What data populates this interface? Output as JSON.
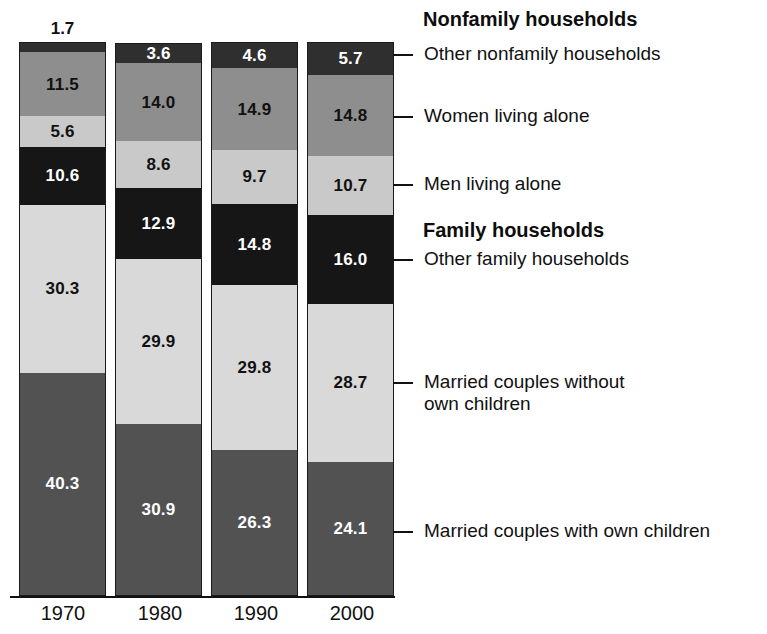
{
  "chart_data": {
    "type": "bar",
    "stacked": true,
    "orientation": "vertical",
    "unit": "percent",
    "ylim": [
      0,
      100
    ],
    "grid": false,
    "legend_position": "right",
    "axis_color": "#111111",
    "categories": [
      "1970",
      "1980",
      "1990",
      "2000"
    ],
    "series": [
      {
        "name": "Other nonfamily households",
        "values": [
          1.7,
          3.6,
          4.6,
          5.7
        ],
        "labels": [
          "1.7",
          "3.6",
          "4.6",
          "5.7"
        ],
        "color": "#2f2f2f",
        "label_color": "#ffffff"
      },
      {
        "name": "Women living alone",
        "values": [
          11.5,
          14.0,
          14.9,
          14.8
        ],
        "labels": [
          "11.5",
          "14.0",
          "14.9",
          "14.8"
        ],
        "color": "#8e8e8e",
        "label_color": "#111111"
      },
      {
        "name": "Men living alone",
        "values": [
          5.6,
          8.6,
          9.7,
          10.7
        ],
        "labels": [
          "5.6",
          "8.6",
          "9.7",
          "10.7"
        ],
        "color": "#c9c9c9",
        "label_color": "#111111"
      },
      {
        "name": "Other family households",
        "values": [
          10.6,
          12.9,
          14.8,
          16.0
        ],
        "labels": [
          "10.6",
          "12.9",
          "14.8",
          "16.0"
        ],
        "color": "#161616",
        "label_color": "#ffffff"
      },
      {
        "name": "Married couples without own children",
        "values": [
          30.3,
          29.9,
          29.8,
          28.7
        ],
        "labels": [
          "30.3",
          "29.9",
          "29.8",
          "28.7"
        ],
        "color": "#d9d9d9",
        "label_color": "#111111"
      },
      {
        "name": "Married couples with own children",
        "values": [
          40.3,
          30.9,
          26.3,
          24.1
        ],
        "labels": [
          "40.3",
          "30.9",
          "26.3",
          "24.1"
        ],
        "color": "#525252",
        "label_color": "#ffffff"
      }
    ]
  },
  "legend": {
    "group_headers": {
      "nonfamily": "Nonfamily households",
      "family": "Family households"
    },
    "items": {
      "other_nonfamily": "Other nonfamily households",
      "women_alone": "Women living alone",
      "men_alone": "Men living alone",
      "other_family": "Other family households",
      "married_without": "Married couples without own children",
      "married_with": "Married couples with own children"
    }
  },
  "x_axis": {
    "labels": [
      "1970",
      "1980",
      "1990",
      "2000"
    ]
  }
}
